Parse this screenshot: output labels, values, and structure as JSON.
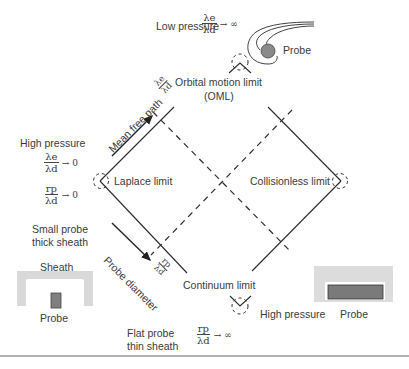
{
  "top": {
    "condition_label": "Low pressure",
    "ratio": {
      "num": "λe",
      "den": "λd",
      "limit": "→ ∞"
    },
    "probe_label": "Probe"
  },
  "oml": {
    "label": "Orbital motion limit",
    "abbr": "(OML)"
  },
  "axes": {
    "mean_free_path": {
      "label": "Mean free path",
      "ratio": {
        "num": "λe",
        "den": "λd"
      }
    },
    "probe_diameter": {
      "label": "Probe diameter",
      "ratio": {
        "num": "rp",
        "den": "λd"
      }
    }
  },
  "left": {
    "condition_label": "High pressure",
    "ratio1": {
      "num": "λe",
      "den": "λd",
      "limit": "→ 0"
    },
    "ratio2": {
      "num": "rp",
      "den": "λd",
      "limit": "→ 0"
    },
    "description_line1": "Small probe",
    "description_line2": "thick sheath",
    "vertex_label": "Laplace limit",
    "sheath_label": "Sheath",
    "probe_label": "Probe"
  },
  "right": {
    "vertex_label": "Collisionless limit",
    "probe_label": "Probe"
  },
  "bottom": {
    "vertex_label": "Continuum limit",
    "condition_label": "High pressure",
    "description_line1": "Flat probe",
    "description_line2": "thin sheath",
    "ratio": {
      "num": "rp",
      "den": "λd",
      "limit": "→ ∞"
    }
  },
  "colors": {
    "line": "#2b2b2b",
    "sheath": "#d9d9d9",
    "probe_fill": "#7f7f7f",
    "separator": "#999999"
  }
}
